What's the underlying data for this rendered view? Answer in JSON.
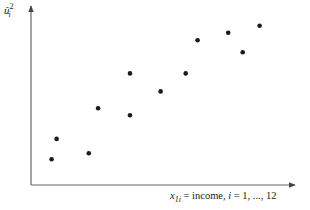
{
  "chart_data": {
    "type": "scatter",
    "title": "",
    "xlabel": "x_{1i} = income, i = 1, ..., 12",
    "ylabel": "û_i^2",
    "xlabel_parts": {
      "var": "x",
      "sub": "1i",
      "rest": " = income, ",
      "idx": "i",
      "range": " = 1, ..., 12"
    },
    "ylabel_parts": {
      "var": "û",
      "sup": "2",
      "sub": "i"
    },
    "grid": false,
    "axis_ticks": false,
    "xlim": [
      0,
      100
    ],
    "ylim": [
      0,
      100
    ],
    "points": [
      {
        "x": 7.8,
        "y": 14.3
      },
      {
        "x": 9.7,
        "y": 25.6
      },
      {
        "x": 21.9,
        "y": 17.6
      },
      {
        "x": 25.4,
        "y": 42.6
      },
      {
        "x": 37.5,
        "y": 38.7
      },
      {
        "x": 37.5,
        "y": 62.0
      },
      {
        "x": 49.1,
        "y": 52.0
      },
      {
        "x": 58.6,
        "y": 62.0
      },
      {
        "x": 63.1,
        "y": 80.4
      },
      {
        "x": 74.7,
        "y": 84.6
      },
      {
        "x": 80.2,
        "y": 73.7
      },
      {
        "x": 86.6,
        "y": 88.5
      }
    ],
    "point_color": "#1a1a1a",
    "axis_color": "#555555"
  }
}
